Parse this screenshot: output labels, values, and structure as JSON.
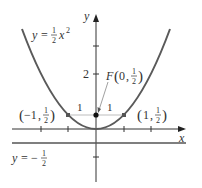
{
  "figure": {
    "curve_label": {
      "lhs": "y",
      "eq": "=",
      "num": "1",
      "den": "2",
      "var": "x",
      "exp": "2"
    },
    "directrix_label": {
      "lhs": "y",
      "eq": "=",
      "sign": "−",
      "num": "1",
      "den": "2"
    },
    "focus_label": {
      "name": "F",
      "open": "(",
      "x": "0",
      "sep": ",",
      "num": "1",
      "den": "2",
      "close": ")"
    },
    "left_point_label": {
      "open": "(",
      "x": "−1",
      "sep": ",",
      "num": "1",
      "den": "2",
      "close": ")"
    },
    "right_point_label": {
      "open": "(",
      "x": "1",
      "sep": ",",
      "num": "1",
      "den": "2",
      "close": ")"
    },
    "segment_left_label": "1",
    "segment_right_label": "1",
    "y_tick_label": "2",
    "x_axis_label": "x",
    "y_axis_label": "y"
  },
  "colors": {
    "parabola": "#5a5a5a",
    "axes": "#333333",
    "directrix": "#555555",
    "segment": "#bdbdbd",
    "point": "#111111"
  }
}
